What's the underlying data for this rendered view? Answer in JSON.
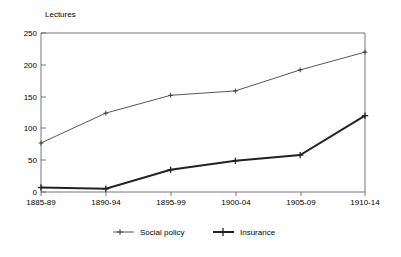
{
  "chart_data": {
    "type": "line",
    "title": "",
    "subtitle": "",
    "xlabel": "",
    "ylabel": "Lectures",
    "categories": [
      "1885-89",
      "1890-94",
      "1895-99",
      "1900-04",
      "1905-09",
      "1910-14"
    ],
    "series": [
      {
        "name": "Social policy",
        "values": [
          77,
          124,
          152,
          159,
          192,
          220
        ],
        "style": "thin-line-with-plus-markers",
        "color": "#444444"
      },
      {
        "name": "Insurance",
        "values": [
          7,
          5,
          35,
          49,
          58,
          120
        ],
        "style": "thick-line-with-plus-markers",
        "color": "#222222"
      }
    ],
    "ylim": [
      0,
      250
    ],
    "ytick_labels": [
      "0",
      "50",
      "100",
      "150",
      "200",
      "250"
    ],
    "ytick_values": [
      0,
      50,
      100,
      150,
      200,
      250
    ],
    "grid": false,
    "legend_position": "bottom"
  },
  "axis": {
    "y_title": "Lectures",
    "y_ticks": [
      "250",
      "200",
      "150",
      "100",
      "50",
      "0"
    ],
    "x_ticks": [
      "1885-89",
      "1890-94",
      "1895-99",
      "1900-04",
      "1905-09",
      "1910-14"
    ]
  },
  "legend": {
    "entries": [
      {
        "label": "Social policy",
        "marker": "thin-line-plus-marker"
      },
      {
        "label": "Insurance",
        "marker": "thick-line-plus-marker"
      }
    ]
  },
  "colors": {
    "background": "#ffffff",
    "frame": "#555555",
    "social_policy": "#444444",
    "insurance": "#222222"
  }
}
